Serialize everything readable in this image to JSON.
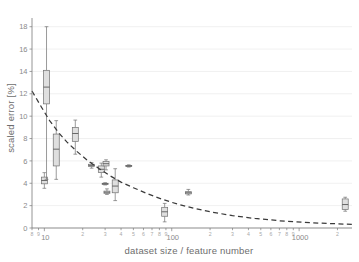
{
  "chart_data": {
    "type": "box",
    "title": "",
    "xlabel": "dataset size / feature number",
    "ylabel": "scaled error [%]",
    "xscale": "log",
    "yscale": "linear",
    "xlim": [
      8,
      2600
    ],
    "ylim": [
      0,
      18.6
    ],
    "grid": true,
    "legend": null,
    "y_ticks": [
      0,
      2,
      4,
      6,
      8,
      10,
      12,
      14,
      16,
      18
    ],
    "y_tick_labels": [
      "0",
      "2",
      "4",
      "6",
      "8",
      "10",
      "12",
      "14",
      "16",
      "18"
    ],
    "x_major_ticks": [
      10,
      100,
      1000
    ],
    "x_major_tick_labels": [
      "10",
      "100",
      "1000"
    ],
    "x_minor_ticks": [
      8,
      9,
      20,
      30,
      40,
      50,
      60,
      70,
      80,
      90,
      200,
      300,
      400,
      500,
      600,
      700,
      800,
      900,
      2000
    ],
    "x_minor_tick_labels": [
      "8",
      "9",
      "2",
      "3",
      "4",
      "5",
      "6",
      "7",
      "8",
      "9",
      "2",
      "3",
      "4",
      "5",
      "6",
      "7",
      "8",
      "9",
      "2"
    ],
    "boxes": [
      {
        "x": 10.0,
        "min": 3.55,
        "q1": 3.95,
        "median": 4.25,
        "q3": 4.55,
        "max": 4.95
      },
      {
        "x": 10.4,
        "min": 4.35,
        "q1": 11.1,
        "median": 12.6,
        "q3": 14.1,
        "max": 18.0
      },
      {
        "x": 12.4,
        "min": 4.35,
        "q1": 5.55,
        "median": 7.05,
        "q3": 8.4,
        "max": 9.6
      },
      {
        "x": 17.5,
        "min": 6.6,
        "q1": 7.75,
        "median": 8.45,
        "q3": 9.0,
        "max": 9.65
      },
      {
        "x": 23.5,
        "min": 5.35,
        "q1": 5.5,
        "median": 5.6,
        "q3": 5.7,
        "max": 5.85
      },
      {
        "x": 28.0,
        "min": 4.55,
        "q1": 4.95,
        "median": 5.25,
        "q3": 5.55,
        "max": 5.8
      },
      {
        "x": 30.5,
        "min": 5.2,
        "q1": 5.55,
        "median": 5.75,
        "q3": 5.95,
        "max": 6.1
      },
      {
        "x": 31.0,
        "min": 3.0,
        "q1": 3.1,
        "median": 3.2,
        "q3": 3.3,
        "max": 3.5
      },
      {
        "x": 30.0,
        "min": 3.85,
        "q1": 3.9,
        "median": 3.95,
        "q3": 4.0,
        "max": 4.05
      },
      {
        "x": 36.0,
        "min": 2.45,
        "q1": 3.15,
        "median": 3.75,
        "q3": 4.3,
        "max": 5.3
      },
      {
        "x": 46.0,
        "min": 5.45,
        "q1": 5.5,
        "median": 5.55,
        "q3": 5.6,
        "max": 5.65
      },
      {
        "x": 88.0,
        "min": 0.55,
        "q1": 1.05,
        "median": 1.45,
        "q3": 1.85,
        "max": 2.2
      },
      {
        "x": 135.0,
        "min": 2.95,
        "q1": 3.05,
        "median": 3.15,
        "q3": 3.25,
        "max": 3.45
      },
      {
        "x": 2300.0,
        "min": 1.5,
        "q1": 1.65,
        "median": 2.1,
        "q3": 2.6,
        "max": 2.75
      }
    ],
    "trend": {
      "style": "dashed",
      "points": [
        {
          "x": 8.0,
          "y": 12.25
        },
        {
          "x": 9.5,
          "y": 10.8
        },
        {
          "x": 11.0,
          "y": 9.6
        },
        {
          "x": 13.0,
          "y": 8.5
        },
        {
          "x": 15.0,
          "y": 7.7
        },
        {
          "x": 18.0,
          "y": 6.85
        },
        {
          "x": 22.0,
          "y": 6.0
        },
        {
          "x": 27.0,
          "y": 5.3
        },
        {
          "x": 33.0,
          "y": 4.65
        },
        {
          "x": 40.0,
          "y": 4.1
        },
        {
          "x": 50.0,
          "y": 3.6
        },
        {
          "x": 65.0,
          "y": 3.05
        },
        {
          "x": 85.0,
          "y": 2.55
        },
        {
          "x": 110.0,
          "y": 2.15
        },
        {
          "x": 150.0,
          "y": 1.75
        },
        {
          "x": 200.0,
          "y": 1.45
        },
        {
          "x": 300.0,
          "y": 1.1
        },
        {
          "x": 450.0,
          "y": 0.85
        },
        {
          "x": 700.0,
          "y": 0.65
        },
        {
          "x": 1100.0,
          "y": 0.5
        },
        {
          "x": 1700.0,
          "y": 0.4
        },
        {
          "x": 2600.0,
          "y": 0.33
        }
      ]
    }
  },
  "colors": {
    "box_fill": "#d9d9d9",
    "box_stroke": "#707070",
    "trend": "#3a3a3a",
    "grid": "#e9e9e9",
    "axis": "#7a7a7a",
    "text": "#6d6d6d",
    "background": "#ffffff"
  }
}
